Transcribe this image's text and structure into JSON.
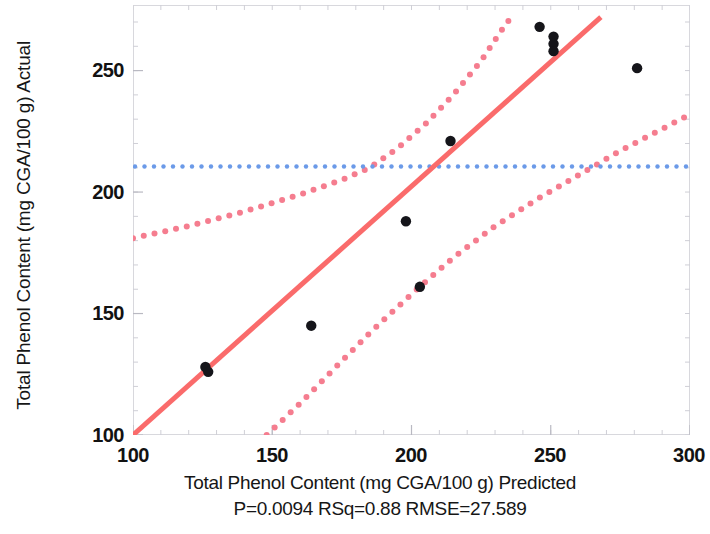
{
  "chart_data": {
    "type": "scatter",
    "title": "",
    "xlabel": "Total Phenol Content (mg CGA/100 g) Predicted",
    "ylabel": "Total Phenol Content (mg CGA/100 g) Actual",
    "caption": "P=0.0094 RSq=0.88 RMSE=27.589",
    "xlim": [
      100,
      300
    ],
    "ylim": [
      100,
      270
    ],
    "xticks": [
      100,
      150,
      200,
      250,
      300
    ],
    "yticks": [
      100,
      150,
      200,
      250
    ],
    "xtick_labels": [
      "100",
      "150",
      "200",
      "250",
      "300"
    ],
    "ytick_labels": [
      "100",
      "150",
      "200",
      "250"
    ],
    "grid": false,
    "legend": "none",
    "stats": {
      "p_value": 0.0094,
      "rsq": 0.88,
      "rmse": 27.589
    },
    "points": [
      {
        "x": 126,
        "y": 128
      },
      {
        "x": 127,
        "y": 126
      },
      {
        "x": 164,
        "y": 145
      },
      {
        "x": 198,
        "y": 188
      },
      {
        "x": 203,
        "y": 161
      },
      {
        "x": 214,
        "y": 221
      },
      {
        "x": 246,
        "y": 268
      },
      {
        "x": 251,
        "y": 264
      },
      {
        "x": 251,
        "y": 261
      },
      {
        "x": 251,
        "y": 258
      },
      {
        "x": 281,
        "y": 251
      }
    ],
    "fit_line": {
      "name": "Linear fit",
      "color": "#fa6b6b",
      "style": "solid",
      "points": [
        [
          100,
          100
        ],
        [
          268,
          272
        ]
      ]
    },
    "mean_line": {
      "name": "Mean of Actual",
      "color": "#6b9ae8",
      "style": "dotted",
      "value": 210.5
    },
    "confidence_upper": {
      "name": "Upper 95% confidence curve",
      "color": "#f57d8f",
      "style": "dotted",
      "points": [
        [
          100,
          181
        ],
        [
          120,
          186
        ],
        [
          140,
          192
        ],
        [
          160,
          199
        ],
        [
          175,
          205
        ],
        [
          185,
          210
        ],
        [
          195,
          218
        ],
        [
          205,
          228
        ],
        [
          215,
          240
        ],
        [
          225,
          254
        ],
        [
          232,
          266
        ],
        [
          237,
          274
        ]
      ]
    },
    "confidence_lower": {
      "name": "Lower 95% confidence curve",
      "color": "#f57d8f",
      "style": "dotted",
      "points": [
        [
          148,
          100
        ],
        [
          160,
          113
        ],
        [
          172,
          127
        ],
        [
          185,
          142
        ],
        [
          200,
          158
        ],
        [
          215,
          173
        ],
        [
          230,
          186
        ],
        [
          245,
          197
        ],
        [
          260,
          207
        ],
        [
          275,
          217
        ],
        [
          290,
          226
        ],
        [
          300,
          232
        ]
      ]
    }
  }
}
